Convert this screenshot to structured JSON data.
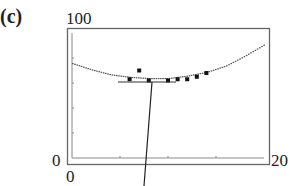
{
  "panel_label": "(c)",
  "axes": {
    "y_max_label": "100",
    "y_min_label": "0",
    "x_min_label": "0",
    "x_max_label": "20"
  },
  "chart_data": {
    "type": "scatter",
    "title": "",
    "xlabel": "",
    "ylabel": "",
    "xlim": [
      0,
      20
    ],
    "ylim": [
      0,
      100
    ],
    "grid": false,
    "series": [
      {
        "name": "data points",
        "kind": "scatter",
        "x": [
          6,
          7,
          8,
          10,
          11,
          12,
          13,
          14
        ],
        "y": [
          63,
          70,
          62,
          62,
          63,
          63,
          65,
          68
        ]
      },
      {
        "name": "quadratic fit",
        "kind": "line",
        "x": [
          0,
          2,
          4,
          6,
          8,
          10,
          12,
          14,
          16,
          18,
          20
        ],
        "y": [
          76,
          71,
          67,
          65,
          64,
          64,
          66,
          69,
          74,
          82,
          91
        ]
      }
    ],
    "annotations": [
      "horizontal segment at minimum with pointer line"
    ]
  }
}
